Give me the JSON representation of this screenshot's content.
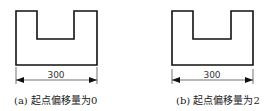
{
  "figures": [
    {
      "id": "a",
      "dimension_label": "300",
      "caption": "(a) 起点偏移量为0",
      "extension_offset": 0
    },
    {
      "id": "b",
      "dimension_label": "300",
      "caption": "(b) 起点偏移量为2",
      "extension_offset": 2
    }
  ],
  "colors": {
    "stroke": "#111111",
    "text": "#222222"
  }
}
